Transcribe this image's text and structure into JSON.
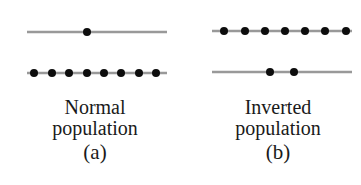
{
  "colors": {
    "line": "#999999",
    "dot": "#0d0d0d",
    "text": "#1a1a1a",
    "background": "#ffffff"
  },
  "panels": [
    {
      "id": "a",
      "title_line1": "Normal",
      "title_line2": "population",
      "label": "(a)",
      "levels": [
        {
          "name": "upper-level",
          "y": 32,
          "x1": 27,
          "x2": 167,
          "particles": [
            87
          ]
        },
        {
          "name": "lower-level",
          "y": 73,
          "x1": 27,
          "x2": 167,
          "particles": [
            34,
            52,
            69,
            87,
            104,
            121,
            139,
            156
          ]
        }
      ]
    },
    {
      "id": "b",
      "title_line1": "Inverted",
      "title_line2": "population",
      "label": "(b)",
      "levels": [
        {
          "name": "upper-level",
          "y": 31,
          "x1": 212,
          "x2": 352,
          "particles": [
            224,
            245,
            265,
            285,
            305,
            325,
            346
          ]
        },
        {
          "name": "lower-level",
          "y": 72,
          "x1": 212,
          "x2": 352,
          "particles": [
            270,
            294
          ]
        }
      ]
    }
  ]
}
